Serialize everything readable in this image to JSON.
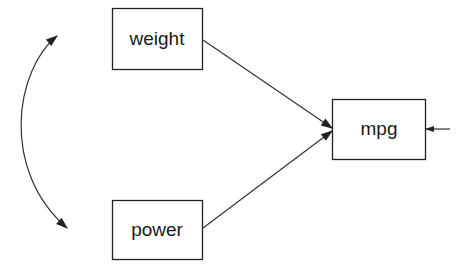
{
  "diagram": {
    "type": "path-diagram",
    "nodes": [
      {
        "id": "weight",
        "label": "weight",
        "x": 112,
        "y": 8,
        "w": 90,
        "h": 61
      },
      {
        "id": "power",
        "label": "power",
        "x": 112,
        "y": 200,
        "w": 90,
        "h": 59
      },
      {
        "id": "mpg",
        "label": "mpg",
        "x": 332,
        "y": 100,
        "w": 93,
        "h": 59
      }
    ],
    "edges": [
      {
        "from": "weight",
        "to": "mpg",
        "kind": "directed"
      },
      {
        "from": "power",
        "to": "mpg",
        "kind": "directed"
      },
      {
        "from": "error",
        "to": "mpg",
        "kind": "directed-error"
      },
      {
        "from": "weight",
        "to": "power",
        "kind": "covariance-curved-double-arrow"
      }
    ],
    "colors": {
      "stroke": "#222222",
      "background": "#ffffff",
      "text": "#1a1a1a"
    }
  }
}
